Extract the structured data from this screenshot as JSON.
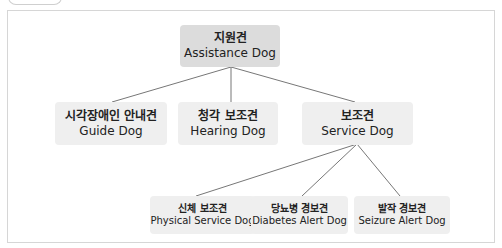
{
  "diagram": {
    "root": {
      "ko": "지원견",
      "en": "Assistance Dog"
    },
    "level2": [
      {
        "ko": "시각장애인 안내견",
        "en": "Guide Dog"
      },
      {
        "ko": "청각 보조견",
        "en": "Hearing Dog"
      },
      {
        "ko": "보조견",
        "en": "Service Dog"
      }
    ],
    "level3": [
      {
        "ko": "신체 보조견",
        "en": "Physical Service Dog"
      },
      {
        "ko": "당뇨병 경보견",
        "en": "Diabetes Alert Dog"
      },
      {
        "ko": "발작 경보견",
        "en": "Seizure Alert Dog"
      }
    ],
    "edges": [
      [
        "Assistance Dog",
        "Guide Dog"
      ],
      [
        "Assistance Dog",
        "Hearing Dog"
      ],
      [
        "Assistance Dog",
        "Service Dog"
      ],
      [
        "Service Dog",
        "Physical Service Dog"
      ],
      [
        "Service Dog",
        "Diabetes Alert Dog"
      ],
      [
        "Service Dog",
        "Seizure Alert Dog"
      ]
    ],
    "colors": {
      "root_fill": "#dcdcdc",
      "node_fill": "#efefef",
      "line": "#777777",
      "frame": "#d6d6d6"
    }
  }
}
